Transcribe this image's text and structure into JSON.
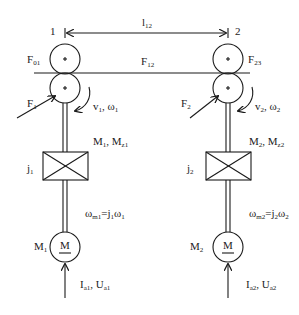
{
  "diagram": {
    "dimension": {
      "label": "l",
      "sub": "12"
    },
    "web_force": {
      "label": "F",
      "sub": "12"
    },
    "stations": [
      {
        "index": "1",
        "tension_in": {
          "label": "F",
          "sub": "01"
        },
        "force": {
          "label": "F",
          "sub": "1"
        },
        "speed": {
          "text": "v",
          "sub1": "1",
          "sep": ", ω",
          "sub2": "1"
        },
        "torques": {
          "text": "M",
          "sub1": "1",
          "sep": ", M",
          "sub2": "z1"
        },
        "gear": {
          "label": "j",
          "sub": "1"
        },
        "motor_speed": {
          "t1": "ω",
          "s1": "m1",
          "t2": "=j",
          "s2": "1",
          "t3": "ω",
          "s3": "1"
        },
        "motor_label": {
          "label": "M",
          "sub": "1"
        },
        "motor_symbol": "M",
        "input": {
          "t1": "I",
          "s1": "a1",
          "t2": ", U",
          "s2": "a1"
        }
      },
      {
        "index": "2",
        "tension_out": {
          "label": "F",
          "sub": "23"
        },
        "force": {
          "label": "F",
          "sub": "2"
        },
        "speed": {
          "text": "v",
          "sub1": "2",
          "sep": ", ω",
          "sub2": "2"
        },
        "torques": {
          "text": "M",
          "sub1": "2",
          "sep": ", M",
          "sub2": "z2"
        },
        "gear": {
          "label": "j",
          "sub": "2"
        },
        "motor_speed": {
          "t1": "ω",
          "s1": "m2",
          "t2": "=j",
          "s2": "2",
          "t3": "ω",
          "s3": "2"
        },
        "motor_label": {
          "label": "M",
          "sub": "2"
        },
        "motor_symbol": "M",
        "input": {
          "t1": "I",
          "s1": "a2",
          "t2": ", U",
          "s2": "a2"
        }
      }
    ],
    "colors": {
      "stroke": "#1a1a1a",
      "background": "#ffffff"
    }
  }
}
